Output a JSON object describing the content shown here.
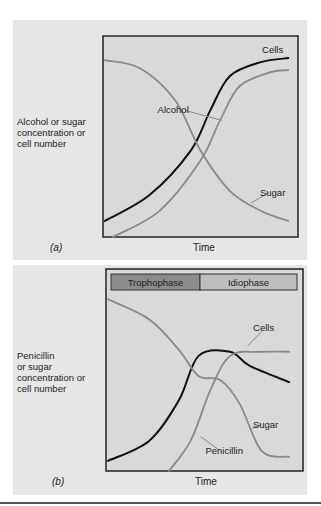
{
  "figure": {
    "panels": [
      {
        "tag": "(a)",
        "ylabel_lines": [
          "Alcohol or sugar",
          "concentration or",
          "cell number"
        ],
        "xlabel": "Time"
      },
      {
        "tag": "(b)",
        "ylabel_lines": [
          "Penicillin",
          "or sugar",
          "concentration or",
          "cell number"
        ],
        "xlabel": "Time",
        "phases": [
          {
            "label": "Trophophase",
            "color": "#8c8c8c"
          },
          {
            "label": "Idiophase",
            "color": "#bdbdbd"
          }
        ]
      }
    ]
  },
  "colors": {
    "panel_bg": "#e6e6e6",
    "plot_bg": "#d9d9d9",
    "black_curve": "#111111",
    "grey_curve": "#8a8a8a",
    "frame": "#222222"
  },
  "chart_data": [
    {
      "type": "line",
      "title": "(a)",
      "xlabel": "Time",
      "ylabel": "Alcohol or sugar concentration or cell number",
      "xlim": [
        0,
        1
      ],
      "ylim": [
        0,
        1
      ],
      "grid": false,
      "legend": "inline labels",
      "series": [
        {
          "name": "Cells",
          "color": "#111111",
          "x": [
            0.01,
            0.24,
            0.45,
            0.55,
            0.65,
            0.81,
            0.95
          ],
          "y": [
            0.08,
            0.21,
            0.43,
            0.63,
            0.8,
            0.87,
            0.89
          ]
        },
        {
          "name": "Alcohol",
          "color": "#8a8a8a",
          "x": [
            0.05,
            0.29,
            0.5,
            0.6,
            0.7,
            0.86,
            0.95
          ],
          "y": [
            0.0,
            0.13,
            0.38,
            0.58,
            0.75,
            0.82,
            0.83
          ]
        },
        {
          "name": "Sugar",
          "color": "#8a8a8a",
          "x": [
            0.01,
            0.19,
            0.37,
            0.5,
            0.65,
            0.81,
            0.95
          ],
          "y": [
            0.88,
            0.84,
            0.68,
            0.43,
            0.23,
            0.13,
            0.08
          ]
        }
      ],
      "annotations": [
        {
          "text": "Cells",
          "x": 0.87,
          "y": 0.93
        },
        {
          "text": "Alcohol",
          "x": 0.36,
          "y": 0.63
        },
        {
          "text": "Sugar",
          "x": 0.87,
          "y": 0.22
        }
      ]
    },
    {
      "type": "line",
      "title": "(b)",
      "xlabel": "Time",
      "ylabel": "Penicillin or sugar concentration or cell number",
      "xlim": [
        0,
        1
      ],
      "ylim": [
        0,
        1
      ],
      "grid": false,
      "legend": "inline labels",
      "phases": [
        "Trophophase",
        "Idiophase"
      ],
      "series": [
        {
          "name": "Cells",
          "color": "#111111",
          "x": [
            0.01,
            0.22,
            0.37,
            0.47,
            0.63,
            0.73,
            0.93
          ],
          "y": [
            0.05,
            0.15,
            0.35,
            0.57,
            0.59,
            0.52,
            0.44
          ]
        },
        {
          "name": "Penicillin",
          "color": "#8a8a8a",
          "x": [
            0.32,
            0.43,
            0.53,
            0.63,
            0.78,
            0.93
          ],
          "y": [
            0.0,
            0.15,
            0.4,
            0.57,
            0.59,
            0.59
          ]
        },
        {
          "name": "Sugar",
          "color": "#8a8a8a",
          "x": [
            0.01,
            0.22,
            0.37,
            0.47,
            0.58,
            0.68,
            0.79,
            0.93
          ],
          "y": [
            0.85,
            0.75,
            0.6,
            0.47,
            0.45,
            0.33,
            0.1,
            0.07
          ]
        }
      ],
      "annotations": [
        {
          "text": "Cells",
          "x": 0.8,
          "y": 0.71
        },
        {
          "text": "Sugar",
          "x": 0.81,
          "y": 0.23
        },
        {
          "text": "Penicillin",
          "x": 0.6,
          "y": 0.1
        }
      ]
    }
  ]
}
